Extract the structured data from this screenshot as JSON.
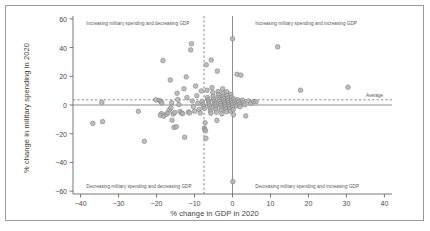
{
  "figure": {
    "background_color": "#ffffff",
    "border_color": "#9a9a9a"
  },
  "chart_data": {
    "type": "scatter",
    "title": "",
    "xlabel": "% change in GDP in 2020",
    "ylabel": "% change in military spending in 2020",
    "xlim": [
      -42,
      42
    ],
    "ylim": [
      -62,
      62
    ],
    "xticks": [
      -40,
      -30,
      -20,
      -10,
      0,
      10,
      20,
      30,
      40
    ],
    "xtick_labels": [
      "−40",
      "−30",
      "−20",
      "−10",
      "0",
      "10",
      "20",
      "30",
      "40"
    ],
    "yticks": [
      60,
      40,
      20,
      0,
      -20,
      -40,
      -60
    ],
    "ytick_labels": [
      "60",
      "40",
      "20",
      "0",
      "−20",
      "−40",
      "−60"
    ],
    "grid": false,
    "legend": null,
    "marker": {
      "shape": "circle",
      "fill_color": "#b3b3b3",
      "edge_color": "#808080",
      "radius_px": 2.3,
      "opacity": 0.85
    },
    "reference_lines": [
      {
        "name": "zero-military-spending-line",
        "orientation": "horizontal",
        "value": 0,
        "style": "solid",
        "color": "#7a7a7a"
      },
      {
        "name": "zero-gdp-line",
        "orientation": "vertical",
        "value": 0,
        "style": "solid",
        "color": "#7a7a7a"
      },
      {
        "name": "average-military-spending-line",
        "orientation": "horizontal",
        "value": 3.6,
        "style": "dashed",
        "color": "#6f6f8f",
        "label": "Average"
      },
      {
        "name": "average-gdp-line",
        "orientation": "vertical",
        "value": -7.5,
        "style": "dashed",
        "color": "#6f6f8f"
      }
    ],
    "annotations": [
      {
        "name": "quadrant-note-top-left",
        "text": "Increasing military spending and decreasing GDP",
        "x": -38.5,
        "y": 56.5,
        "align": "left"
      },
      {
        "name": "quadrant-note-top-right",
        "text": "Increasing military spending and increasing GDP",
        "x": 6,
        "y": 56.5,
        "align": "left"
      },
      {
        "name": "quadrant-note-bottom-left",
        "text": "Decreasing military spending and decreasing GDP",
        "x": -38.5,
        "y": -57,
        "align": "left"
      },
      {
        "name": "quadrant-note-bottom-right",
        "text": "Decreasing military spending and increasing GDP",
        "x": 6,
        "y": -57,
        "align": "left"
      }
    ],
    "points": [
      [
        -36.8,
        -12.8
      ],
      [
        -34.2,
        -11.6
      ],
      [
        -34.4,
        1.9
      ],
      [
        -23.2,
        -25.3
      ],
      [
        -24.8,
        -4.4
      ],
      [
        -20.2,
        3.6
      ],
      [
        -19.3,
        3.1
      ],
      [
        -18.9,
        2.5
      ],
      [
        -18.6,
        1.4
      ],
      [
        -18.3,
        30.9
      ],
      [
        -18.7,
        -6.0
      ],
      [
        -19.0,
        -7.2
      ],
      [
        -18.1,
        -7.8
      ],
      [
        -17.4,
        -6.4
      ],
      [
        -17.0,
        -5.4
      ],
      [
        -16.6,
        -3.3
      ],
      [
        -16.2,
        -2.0
      ],
      [
        -16.4,
        17.4
      ],
      [
        -16.0,
        1.6
      ],
      [
        -15.6,
        -6.2
      ],
      [
        -15.2,
        -5.2
      ],
      [
        -15.9,
        -10.6
      ],
      [
        -15.4,
        -15.6
      ],
      [
        -14.8,
        -15.1
      ],
      [
        -14.6,
        8.2
      ],
      [
        -14.4,
        3.8
      ],
      [
        -14.1,
        0.3
      ],
      [
        -13.8,
        -4.6
      ],
      [
        -13.4,
        -5.6
      ],
      [
        -13.1,
        -6.0
      ],
      [
        -12.8,
        11.3
      ],
      [
        -12.6,
        -22.5
      ],
      [
        -12.2,
        19.6
      ],
      [
        -12.0,
        5.2
      ],
      [
        -11.6,
        -4.9
      ],
      [
        -11.3,
        -5.5
      ],
      [
        -11.0,
        38.4
      ],
      [
        -10.8,
        42.7
      ],
      [
        -10.6,
        2.8
      ],
      [
        -10.3,
        -1.2
      ],
      [
        -10.0,
        -4.4
      ],
      [
        -9.7,
        13.2
      ],
      [
        -9.4,
        6.4
      ],
      [
        -9.1,
        1.2
      ],
      [
        -8.8,
        -3.1
      ],
      [
        -8.5,
        -5.6
      ],
      [
        -8.2,
        9.8
      ],
      [
        -8.0,
        2.4
      ],
      [
        -7.8,
        0.4
      ],
      [
        -7.6,
        -1.0
      ],
      [
        -7.4,
        -2.4
      ],
      [
        -7.2,
        -12.4
      ],
      [
        -7.4,
        -16.1
      ],
      [
        -7.3,
        -17.2
      ],
      [
        -7.1,
        -18.0
      ],
      [
        -7.0,
        -23.2
      ],
      [
        -6.9,
        28.0
      ],
      [
        -6.7,
        10.3
      ],
      [
        -6.6,
        5.2
      ],
      [
        -6.4,
        3.5
      ],
      [
        -6.3,
        2.0
      ],
      [
        -6.2,
        0.7
      ],
      [
        -6.0,
        -0.8
      ],
      [
        -5.9,
        -2.3
      ],
      [
        -5.8,
        -4.2
      ],
      [
        -5.7,
        -5.8
      ],
      [
        -5.6,
        31.3
      ],
      [
        -5.4,
        12.1
      ],
      [
        -5.2,
        8.6
      ],
      [
        -5.1,
        6.0
      ],
      [
        -5.0,
        4.2
      ],
      [
        -4.8,
        2.6
      ],
      [
        -4.7,
        1.2
      ],
      [
        -4.6,
        0.0
      ],
      [
        -4.5,
        -1.4
      ],
      [
        -4.4,
        -3.0
      ],
      [
        -4.2,
        -5.0
      ],
      [
        -4.1,
        -10.7
      ],
      [
        -4.0,
        23.6
      ],
      [
        -3.8,
        9.4
      ],
      [
        -3.7,
        7.2
      ],
      [
        -3.6,
        5.4
      ],
      [
        -3.5,
        3.8
      ],
      [
        -3.4,
        2.4
      ],
      [
        -3.2,
        1.0
      ],
      [
        -3.1,
        -0.4
      ],
      [
        -3.0,
        -2.0
      ],
      [
        -2.9,
        -3.6
      ],
      [
        -2.8,
        -6.2
      ],
      [
        -2.6,
        11.2
      ],
      [
        -2.5,
        8.0
      ],
      [
        -2.4,
        6.1
      ],
      [
        -2.3,
        4.4
      ],
      [
        -2.2,
        2.8
      ],
      [
        -2.0,
        1.4
      ],
      [
        -1.9,
        0.2
      ],
      [
        -1.8,
        -1.2
      ],
      [
        -1.7,
        -2.8
      ],
      [
        -1.6,
        -4.6
      ],
      [
        -1.5,
        9.2
      ],
      [
        -1.4,
        6.8
      ],
      [
        -1.2,
        4.8
      ],
      [
        -1.1,
        3.2
      ],
      [
        -1.0,
        1.8
      ],
      [
        -0.9,
        0.4
      ],
      [
        -0.8,
        -1.0
      ],
      [
        -0.6,
        -2.6
      ],
      [
        -0.5,
        -4.4
      ],
      [
        -0.4,
        7.4
      ],
      [
        -0.3,
        5.2
      ],
      [
        -0.2,
        3.4
      ],
      [
        -0.1,
        1.6
      ],
      [
        0.0,
        0.2
      ],
      [
        0.1,
        -1.4
      ],
      [
        0.2,
        -3.2
      ],
      [
        0.3,
        -6.8
      ],
      [
        0.0,
        46.2
      ],
      [
        0.1,
        -53.4
      ],
      [
        0.4,
        4.2
      ],
      [
        0.6,
        2.6
      ],
      [
        0.8,
        1.0
      ],
      [
        1.0,
        -0.6
      ],
      [
        1.2,
        21.4
      ],
      [
        1.4,
        3.6
      ],
      [
        1.6,
        2.0
      ],
      [
        1.8,
        0.4
      ],
      [
        2.0,
        -1.2
      ],
      [
        2.2,
        20.8
      ],
      [
        2.6,
        3.4
      ],
      [
        2.9,
        1.8
      ],
      [
        3.2,
        0.2
      ],
      [
        3.5,
        -7.6
      ],
      [
        4.2,
        2.8
      ],
      [
        4.8,
        1.2
      ],
      [
        5.6,
        2.4
      ],
      [
        6.2,
        2.2
      ],
      [
        11.9,
        40.5
      ],
      [
        17.9,
        10.3
      ],
      [
        30.4,
        12.4
      ]
    ]
  },
  "average_annotation": {
    "label": "Average"
  }
}
